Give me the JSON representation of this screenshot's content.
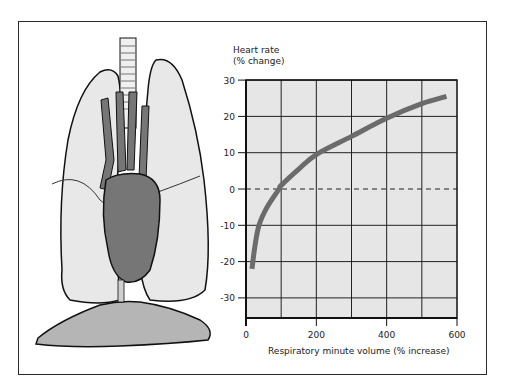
{
  "chart_data": {
    "type": "line",
    "title": "",
    "xlabel": "Respiratory minute volume (% increase)",
    "ylabel_line1": "Heart rate",
    "ylabel_line2": "(% change)",
    "xlim": [
      0,
      600
    ],
    "ylim": [
      -35,
      30
    ],
    "x_ticks": [
      0,
      200,
      400,
      600
    ],
    "x_tick_labels": [
      "0",
      "200",
      "400",
      "600"
    ],
    "x_gridlines": [
      100,
      200,
      300,
      400,
      500
    ],
    "y_ticks": [
      30,
      20,
      10,
      0,
      -10,
      -20,
      -30
    ],
    "y_tick_labels": [
      "30",
      "20",
      "10",
      "0",
      "-10",
      "-20",
      "-30"
    ],
    "grid": true,
    "reference_line": {
      "y": 0,
      "style": "dashed"
    },
    "legend": null,
    "series": [
      {
        "name": "Heart rate response",
        "color": "#6b6b6b",
        "x": [
          17,
          25,
          37,
          60,
          94,
          100,
          150,
          200,
          300,
          400,
          500,
          570
        ],
        "y": [
          -22,
          -16,
          -10,
          -5,
          0,
          1,
          5.5,
          9.5,
          14.5,
          19.5,
          23.5,
          25.5
        ]
      }
    ],
    "plot_background": "#e6e6e6"
  },
  "illustration": {
    "subject": "lungs-heart-diaphragm",
    "lung_color": "#e8e8e8",
    "heart_color": "#767676",
    "diaphragm_color": "#b5b5b5",
    "trachea_color": "#f0f0f0"
  }
}
